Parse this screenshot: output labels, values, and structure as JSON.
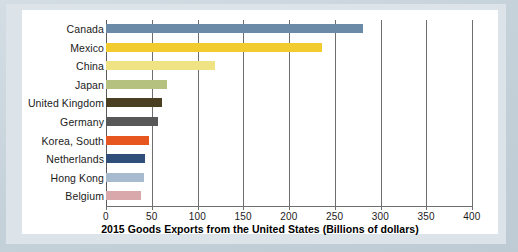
{
  "chart_data": {
    "type": "bar",
    "orientation": "horizontal",
    "title": "2015 Goods Exports from the United States (Billions of dollars)",
    "xlabel": "2015 Goods Exports from the United States (Billions of dollars)",
    "ylabel": "",
    "xlim": [
      0,
      400
    ],
    "ylim": null,
    "grid": true,
    "legend": null,
    "xticks": [
      0,
      50,
      100,
      150,
      200,
      250,
      300,
      350,
      400
    ],
    "xtick_labels": [
      "0",
      "50",
      "100",
      "150",
      "200",
      "250",
      "300",
      "350",
      "400"
    ],
    "categories": [
      "Canada",
      "Mexico",
      "China",
      "Japan",
      "United Kingdom",
      "Germany",
      "Korea, South",
      "Netherlands",
      "Hong Kong",
      "Belgium"
    ],
    "values": [
      281,
      236,
      119,
      67,
      61,
      57,
      47,
      43,
      41,
      38
    ],
    "bar_colors": [
      "#6b8aa8",
      "#f2cb2e",
      "#f0e383",
      "#b5c17f",
      "#4a3f21",
      "#585858",
      "#e8561f",
      "#2f4f7a",
      "#a8bacd",
      "#d8a8ab"
    ]
  },
  "figure": {
    "background_color": "#c9d4dc",
    "panel_color": "#ffffff",
    "gridline_color": "#6e6e6e",
    "text_color": "#1b1b1b"
  }
}
